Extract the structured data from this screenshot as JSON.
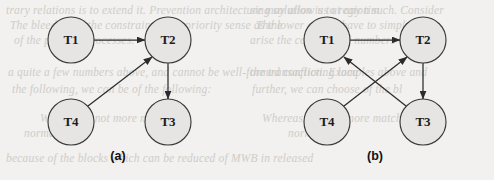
{
  "figure": {
    "panels": [
      {
        "id": "panel-a",
        "caption": "(a)",
        "caption_x": 118,
        "caption_y": 160,
        "nodes": [
          {
            "id": "a-T1",
            "label": "T1",
            "cx": 71,
            "cy": 40,
            "r": 23
          },
          {
            "id": "a-T2",
            "label": "T2",
            "cx": 168,
            "cy": 40,
            "r": 23
          },
          {
            "id": "a-T4",
            "label": "T4",
            "cx": 71,
            "cy": 122,
            "r": 23
          },
          {
            "id": "a-T3",
            "label": "T3",
            "cx": 168,
            "cy": 122,
            "r": 23
          }
        ],
        "edges": [
          {
            "id": "a-edge-t1-t2",
            "from": "T1",
            "to": "T2",
            "x1": 94,
            "y1": 40,
            "x2": 145,
            "y2": 40
          },
          {
            "id": "a-edge-t4-t2",
            "from": "T4",
            "to": "T2",
            "x1": 88,
            "y1": 106,
            "x2": 152,
            "y2": 57
          },
          {
            "id": "a-edge-t2-t3",
            "from": "T2",
            "to": "T3",
            "x1": 168,
            "y1": 63,
            "x2": 168,
            "y2": 99
          }
        ]
      },
      {
        "id": "panel-b",
        "caption": "(b)",
        "caption_x": 375,
        "caption_y": 160,
        "nodes": [
          {
            "id": "b-T1",
            "label": "T1",
            "cx": 327,
            "cy": 40,
            "r": 23
          },
          {
            "id": "b-T2",
            "label": "T2",
            "cx": 423,
            "cy": 40,
            "r": 23
          },
          {
            "id": "b-T4",
            "label": "T4",
            "cx": 327,
            "cy": 122,
            "r": 23
          },
          {
            "id": "b-T3",
            "label": "T3",
            "cx": 423,
            "cy": 122,
            "r": 23
          }
        ],
        "edges": [
          {
            "id": "b-edge-t1-t2",
            "from": "T1",
            "to": "T2",
            "x1": 350,
            "y1": 40,
            "x2": 400,
            "y2": 40
          },
          {
            "id": "b-edge-t4-t2",
            "from": "T4",
            "to": "T2",
            "x1": 344,
            "y1": 106,
            "x2": 407,
            "y2": 57
          },
          {
            "id": "b-edge-t3-t1",
            "from": "T3",
            "to": "T1",
            "x1": 406,
            "y1": 106,
            "x2": 344,
            "y2": 57
          },
          {
            "id": "b-edge-t2-t3",
            "from": "T2",
            "to": "T3",
            "x1": 423,
            "y1": 63,
            "x2": 423,
            "y2": 99
          }
        ]
      }
    ],
    "colors": {
      "background": "#f2f1ef",
      "node_fill": "#e6e5e3",
      "node_stroke": "#3a3a3a",
      "edge_stroke": "#2b2b2b",
      "label_color": "#1d1d1d",
      "ghost_text": "#c9c7c4"
    },
    "background_text": [
      {
        "id": "ghost-1",
        "text": "trary relations is to extend it. Prevention architecture may allow us at any tim",
        "x": 6,
        "y": 4,
        "size": 11.5
      },
      {
        "id": "ghost-2",
        "text": "The bleeding of the constrained is a priority sense as the",
        "x": 10,
        "y": 19,
        "size": 11.5
      },
      {
        "id": "ghost-3",
        "text": "of the parallel processes.",
        "x": 14,
        "y": 34,
        "size": 11.5
      },
      {
        "id": "ghost-4",
        "text": "a quite a few numbers above, and cannot be well-formed conflicting loca",
        "x": 8,
        "y": 66,
        "size": 11.5
      },
      {
        "id": "ghost-5",
        "text": "the following, we can be of the following:",
        "x": 12,
        "y": 83,
        "size": 11.5
      },
      {
        "id": "ghost-6",
        "text": "Where it is not more matched",
        "x": 40,
        "y": 112,
        "size": 11.5
      },
      {
        "id": "ghost-7",
        "text": "normal.",
        "x": 24,
        "y": 127,
        "size": 11.5
      },
      {
        "id": "ghost-8",
        "text": "because of the blocks which can be reduced of MWB in released",
        "x": 6,
        "y": 152,
        "size": 11.5
      },
      {
        "id": "ghost-9",
        "text": "sing solution is to region such. Consider",
        "x": 250,
        "y": 4,
        "size": 11.5
      },
      {
        "id": "ghost-10",
        "text": "The lower of that have to simply",
        "x": 256,
        "y": 19,
        "size": 11.5
      },
      {
        "id": "ghost-11",
        "text": "arise the constrained numbers of prior",
        "x": 250,
        "y": 34,
        "size": 11.5
      },
      {
        "id": "ghost-12",
        "text": "the transaction. Examples above and",
        "x": 250,
        "y": 66,
        "size": 11.5
      },
      {
        "id": "ghost-13",
        "text": "further, we can choose of the bl",
        "x": 252,
        "y": 83,
        "size": 11.5
      },
      {
        "id": "ghost-14",
        "text": "Whereas it is not more match",
        "x": 262,
        "y": 112,
        "size": 11.5
      },
      {
        "id": "ghost-15",
        "text": "normal.",
        "x": 288,
        "y": 127,
        "size": 11.5
      }
    ]
  }
}
